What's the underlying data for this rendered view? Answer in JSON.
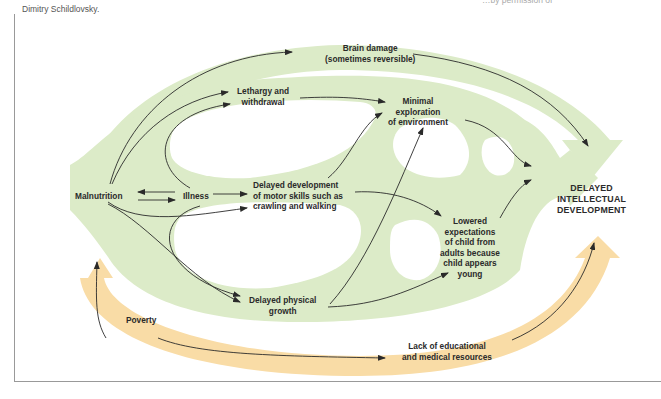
{
  "caption": {
    "line1_partial": "…by permission of",
    "line2": "Dimitry Schildlovsky."
  },
  "nodes": {
    "malnutrition": "Malnutrition",
    "illness": "Illness",
    "brain_damage_l1": "Brain damage",
    "brain_damage_l2": "(sometimes reversible)",
    "lethargy_l1": "Lethargy and",
    "lethargy_l2": "withdrawal",
    "minimal_l1": "Minimal",
    "minimal_l2": "exploration",
    "minimal_l3": "of environment",
    "motor_l1": "Delayed development",
    "motor_l2": "of motor skills such as",
    "motor_l3": "crawling and walking",
    "lowered_l1": "Lowered",
    "lowered_l2": "expectations",
    "lowered_l3": "of child from",
    "lowered_l4": "adults because",
    "lowered_l5": "child appears",
    "lowered_l6": "young",
    "physical_l1": "Delayed physical",
    "physical_l2": "growth",
    "outcome_l1": "DELAYED",
    "outcome_l2": "INTELLECTUAL",
    "outcome_l3": "DEVELOPMENT",
    "poverty": "Poverty",
    "lack_l1": "Lack of educational",
    "lack_l2": "and medical resources"
  },
  "colors": {
    "green_band": "#dcebc8",
    "orange_band": "#f9dca6",
    "arrow": "#2a2a2a",
    "text": "#2a2a2a"
  }
}
